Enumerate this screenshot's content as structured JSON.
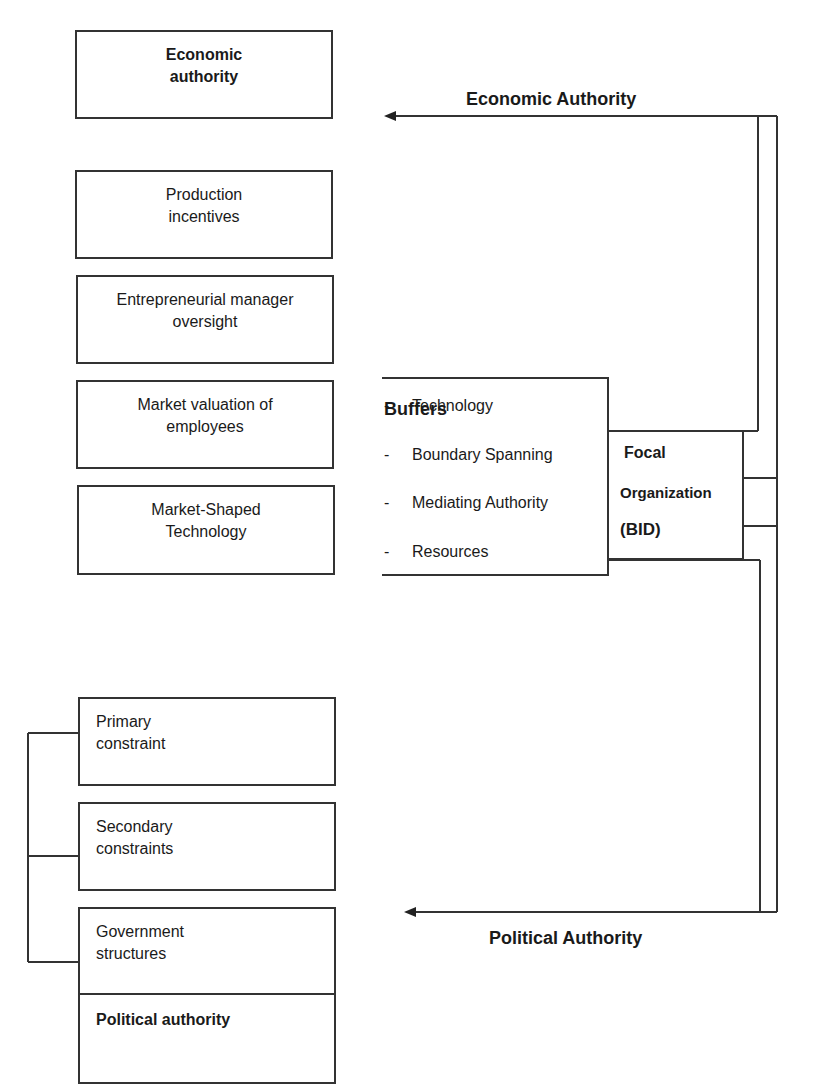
{
  "economic_side": {
    "header_box": "Economic authority",
    "boxes": [
      {
        "label": "Production incentives"
      },
      {
        "label": "Entrepreneurial manager oversight"
      },
      {
        "label": "Market valuation of employees"
      },
      {
        "label": "Market-Shaped Technology"
      }
    ],
    "arrow_label": "Economic Authority"
  },
  "buffers": {
    "title": "Buffers",
    "items": [
      {
        "dash": "-",
        "label": "Technology"
      },
      {
        "dash": "-",
        "label": "Boundary Spanning"
      },
      {
        "dash": "-",
        "label": "Mediating Authority"
      },
      {
        "dash": "-",
        "label": "Resources"
      }
    ]
  },
  "focal": {
    "line1": "Focal",
    "line2": "Organization",
    "line3": "(BID)"
  },
  "political_side": {
    "boxes": [
      {
        "label_line1": "Primary",
        "label_line2": "constraint"
      },
      {
        "label_line1": "Secondary",
        "label_line2": "constraints"
      },
      {
        "label_line1": "Government",
        "label_line2": "structures"
      }
    ],
    "footer_box": "Political authority",
    "arrow_label": "Political Authority"
  },
  "colors": {
    "line": "#333333",
    "text": "#1a1a1a",
    "background": "#ffffff"
  }
}
